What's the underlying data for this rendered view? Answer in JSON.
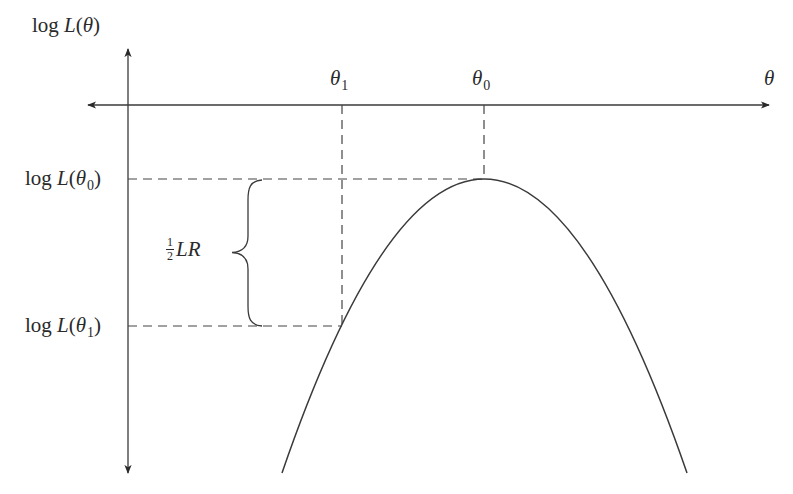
{
  "diagram": {
    "y_axis_label": {
      "prefix": "log ",
      "func": "L",
      "open": "(",
      "var": "θ",
      "close": ")"
    },
    "x_axis_label": "θ",
    "x_ticks": [
      {
        "symbol": "θ",
        "subscript": "1"
      },
      {
        "symbol": "θ",
        "subscript": "0"
      }
    ],
    "y_ticks": [
      {
        "prefix": "log ",
        "func": "L",
        "open": "(",
        "var": "θ",
        "subscript": "0",
        "close": ")"
      },
      {
        "prefix": "log ",
        "func": "L",
        "open": "(",
        "var": "θ",
        "subscript": "1",
        "close": ")"
      }
    ],
    "brace_label": {
      "frac_num": "1",
      "frac_den": "2",
      "text": "LR"
    },
    "colors": {
      "line": "#3a3a3a",
      "dash": "#444444",
      "curve": "#3a3a3a",
      "background": "#ffffff"
    },
    "geometry": {
      "origin": {
        "x": 128,
        "y": 105
      },
      "x_axis": {
        "x1": 87,
        "x2": 770,
        "y": 105
      },
      "y_axis": {
        "x": 128,
        "y1": 48,
        "y2": 474
      },
      "peak": {
        "x": 484,
        "y": 179
      },
      "theta1_point": {
        "x": 342,
        "y": 326
      },
      "curve_left_end": {
        "x": 282,
        "y": 473
      },
      "curve_right_end": {
        "x": 687,
        "y": 473
      }
    }
  }
}
